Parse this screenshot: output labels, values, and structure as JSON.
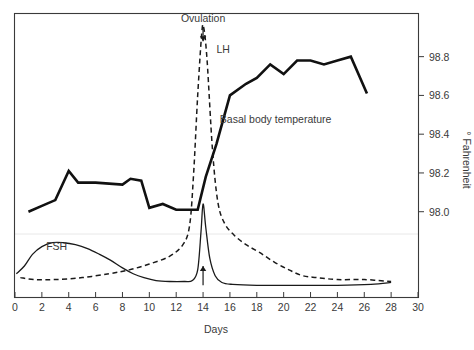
{
  "chart_data": {
    "type": "line",
    "title": "",
    "subtitle": "",
    "xlabel": "Days",
    "ylabel": "° Fahrenheit",
    "xlim": [
      0,
      30
    ],
    "ylim": [
      97.56,
      99.02
    ],
    "grid": false,
    "legend_position": "inline-labels",
    "x_ticks": [
      0,
      2,
      4,
      6,
      8,
      10,
      12,
      14,
      16,
      18,
      20,
      22,
      24,
      26,
      28,
      30
    ],
    "x_tick_labels": [
      "0",
      "2",
      "4",
      "6",
      "8",
      "10",
      "12",
      "14",
      "16",
      "18",
      "20",
      "22",
      "24",
      "26",
      "28",
      "30"
    ],
    "y_ticks": [
      98.0,
      98.2,
      98.4,
      98.6,
      98.8
    ],
    "y_tick_labels": [
      "98.0",
      "98.2",
      "98.4",
      "98.6",
      "98.8"
    ],
    "annotations": [
      {
        "name": "ovulation",
        "text": "Ovulation",
        "x": 14,
        "pointer": "down-arrow",
        "text_y": 98.98,
        "arrow_from_y": 98.95,
        "arrow_to_y": 98.88
      },
      {
        "name": "ovulation-up-arrow",
        "text": "",
        "x": 14,
        "pointer": "up-arrow",
        "arrow_from_y": 97.62,
        "arrow_to_y": 97.72
      }
    ],
    "series": [
      {
        "name": "Basal body temperature",
        "label": "Basal body temperature",
        "style": "solid-thick",
        "label_x": 19.4,
        "label_y": 98.46,
        "points": [
          [
            1.0,
            98.0
          ],
          [
            2.0,
            98.03
          ],
          [
            3.0,
            98.06
          ],
          [
            4.0,
            98.21
          ],
          [
            4.7,
            98.15
          ],
          [
            6.0,
            98.15
          ],
          [
            8.0,
            98.14
          ],
          [
            8.6,
            98.17
          ],
          [
            9.4,
            98.16
          ],
          [
            10.0,
            98.02
          ],
          [
            11.0,
            98.04
          ],
          [
            12.0,
            98.01
          ],
          [
            13.0,
            98.01
          ],
          [
            13.6,
            98.01
          ],
          [
            14.2,
            98.18
          ],
          [
            15.0,
            98.35
          ],
          [
            16.0,
            98.6
          ],
          [
            17.2,
            98.66
          ],
          [
            18.0,
            98.69
          ],
          [
            19.0,
            98.76
          ],
          [
            20.0,
            98.71
          ],
          [
            21.0,
            98.78
          ],
          [
            22.0,
            98.78
          ],
          [
            23.0,
            98.76
          ],
          [
            24.0,
            98.78
          ],
          [
            25.0,
            98.8
          ],
          [
            26.2,
            98.61
          ]
        ]
      },
      {
        "name": "LH",
        "label": "LH",
        "style": "dashed",
        "label_x": 15.0,
        "label_y": 98.82,
        "points": [
          [
            0.4,
            97.66
          ],
          [
            1.5,
            97.65
          ],
          [
            3.0,
            97.65
          ],
          [
            5.0,
            97.66
          ],
          [
            7.0,
            97.68
          ],
          [
            8.5,
            97.7
          ],
          [
            10.0,
            97.73
          ],
          [
            11.5,
            97.77
          ],
          [
            12.5,
            97.83
          ],
          [
            13.0,
            97.93
          ],
          [
            13.3,
            98.2
          ],
          [
            13.6,
            98.6
          ],
          [
            13.9,
            98.92
          ],
          [
            14.05,
            98.95
          ],
          [
            14.3,
            98.78
          ],
          [
            14.7,
            98.32
          ],
          [
            15.1,
            98.05
          ],
          [
            15.6,
            97.94
          ],
          [
            16.3,
            97.88
          ],
          [
            17.2,
            97.83
          ],
          [
            18.2,
            97.79
          ],
          [
            19.3,
            97.74
          ],
          [
            20.4,
            97.7
          ],
          [
            21.4,
            97.67
          ],
          [
            22.5,
            97.66
          ],
          [
            24.0,
            97.65
          ],
          [
            26.0,
            97.65
          ],
          [
            28.0,
            97.64
          ]
        ]
      },
      {
        "name": "FSH",
        "label": "FSH",
        "style": "solid-thin",
        "label_x": 3.1,
        "label_y": 97.8,
        "points": [
          [
            0.1,
            97.68
          ],
          [
            0.7,
            97.72
          ],
          [
            1.3,
            97.78
          ],
          [
            2.0,
            97.82
          ],
          [
            2.8,
            97.84
          ],
          [
            3.6,
            97.84
          ],
          [
            4.5,
            97.83
          ],
          [
            5.4,
            97.81
          ],
          [
            6.3,
            97.78
          ],
          [
            7.1,
            97.75
          ],
          [
            8.0,
            97.71
          ],
          [
            8.8,
            97.68
          ],
          [
            9.6,
            97.66
          ],
          [
            10.5,
            97.645
          ],
          [
            11.5,
            97.64
          ],
          [
            12.6,
            97.64
          ],
          [
            13.2,
            97.645
          ],
          [
            13.6,
            97.7
          ],
          [
            13.85,
            97.9
          ],
          [
            14.0,
            98.04
          ],
          [
            14.2,
            97.92
          ],
          [
            14.5,
            97.76
          ],
          [
            14.9,
            97.67
          ],
          [
            15.4,
            97.635
          ],
          [
            16.2,
            97.625
          ],
          [
            18.0,
            97.62
          ],
          [
            21.0,
            97.62
          ],
          [
            24.0,
            97.62
          ],
          [
            26.5,
            97.625
          ],
          [
            28.0,
            97.635
          ]
        ]
      }
    ]
  },
  "axes": {
    "x_axis_title": "Days",
    "y_axis_title": "° Fahrenheit"
  }
}
